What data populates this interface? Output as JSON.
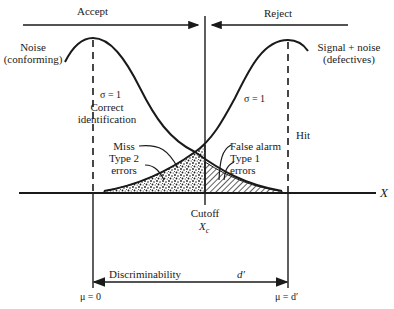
{
  "diagram": {
    "regions": {
      "accept": "Accept",
      "reject": "Reject"
    },
    "distributions": {
      "noise": {
        "line1": "Noise",
        "line2": "(conforming)",
        "sigma": "σ = 1",
        "mean": "μ = 0"
      },
      "signal": {
        "line1": "Signal + noise",
        "line2": "(defectives)",
        "sigma": "σ = 1",
        "mean": "μ = d′"
      }
    },
    "outcomes": {
      "correct": {
        "line1": "Correct",
        "line2": "identification"
      },
      "miss": {
        "line1": "Miss",
        "line2": "Type 2",
        "line3": "errors"
      },
      "false_alarm": {
        "line1": "False alarm",
        "line2": "Type 1",
        "line3": "errors"
      },
      "hit": "Hit"
    },
    "cutoff": {
      "label": "Cutoff",
      "symbol": "X",
      "subscript": "c"
    },
    "axis": {
      "x_label": "X"
    },
    "discriminability": {
      "label": "Discriminability",
      "symbol": "d′"
    },
    "colors": {
      "ink": "#1a1a1a",
      "background": "#ffffff"
    }
  }
}
